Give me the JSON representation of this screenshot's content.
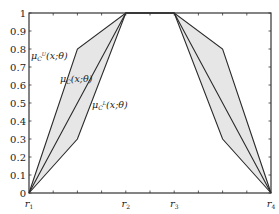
{
  "chart_data": {
    "type": "line",
    "title": "",
    "xlabel": "",
    "ylabel": "",
    "xlim": [
      0,
      10
    ],
    "ylim": [
      0,
      1
    ],
    "grid": false,
    "x_tick_labels": [
      {
        "x": 0,
        "label": "r₁",
        "sub": "1"
      },
      {
        "x": 4,
        "label": "r₂",
        "sub": "2"
      },
      {
        "x": 6,
        "label": "r₃",
        "sub": "3"
      },
      {
        "x": 10,
        "label": "r₄",
        "sub": "4"
      }
    ],
    "x_minor_ticks": [
      1,
      2,
      3,
      4,
      5,
      6,
      7,
      8,
      9
    ],
    "y_ticks": [
      0,
      0.1,
      0.2,
      0.3,
      0.4,
      0.5,
      0.6,
      0.7,
      0.8,
      0.9,
      1
    ],
    "y_tick_labels": [
      "0",
      "0.1",
      "0.2",
      "0.3",
      "0.4",
      "0.5",
      "0.6",
      "0.7",
      "0.8",
      "0.9",
      "1"
    ],
    "series": [
      {
        "name": "upper",
        "label": "μ_C^U(x;θ)",
        "x": [
          0,
          2,
          4,
          6,
          8,
          10
        ],
        "y": [
          0,
          0.8,
          1,
          1,
          0.8,
          0
        ]
      },
      {
        "name": "middle",
        "label": "μ_C(x;θ)",
        "x": [
          0,
          4,
          6,
          10
        ],
        "y": [
          0,
          1,
          1,
          0
        ]
      },
      {
        "name": "lower",
        "label": "μ_C^L(x;θ)",
        "x": [
          0,
          2,
          4,
          6,
          8,
          10
        ],
        "y": [
          0,
          0.3,
          1,
          1,
          0.3,
          0
        ]
      }
    ],
    "shaded_region": "between upper and lower",
    "annotations": [
      {
        "text": "μ_C^U(x;θ)",
        "x": 0.1,
        "y": 0.76
      },
      {
        "text": "μ_C(x;θ)",
        "x": 1.3,
        "y": 0.63
      },
      {
        "text": "μ_C^L(x;θ)",
        "x": 2.6,
        "y": 0.47
      }
    ]
  },
  "labels": {
    "upper_mu": "μ",
    "upper_sub": "C",
    "upper_sup": "U",
    "upper_args": "(x;θ)",
    "mid_mu": "μ",
    "mid_sub": "C",
    "mid_args": "(x;θ)",
    "lower_mu": "μ",
    "lower_sub": "C",
    "lower_sup": "L",
    "lower_args": "(x;θ)",
    "r_letter": "r"
  }
}
